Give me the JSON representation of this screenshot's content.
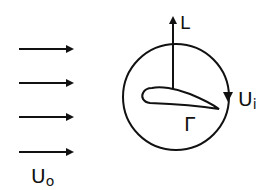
{
  "diagram": {
    "freestream": {
      "label": "U",
      "subscript": "o",
      "arrow_count": 4
    },
    "lift": {
      "label": "L"
    },
    "induced_velocity": {
      "label": "U",
      "subscript": "i"
    },
    "circulation": {
      "label": "Γ"
    },
    "colors": {
      "stroke": "#111111",
      "background": "#ffffff"
    }
  }
}
